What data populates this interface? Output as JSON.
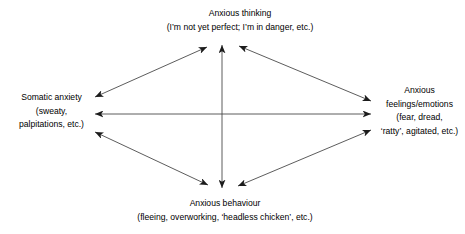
{
  "diagram": {
    "type": "four-node bidirectional cycle",
    "background_color": "#ffffff",
    "text_color": "#000000",
    "arrow_color": "#3b3b3b",
    "nodes": {
      "thinking": {
        "name": "Anxious thinking",
        "lines": [
          "Anxious thinking",
          "(I’m not yet perfect; I’m in danger, etc.)"
        ]
      },
      "somatic": {
        "name": "Somatic anxiety",
        "lines": [
          "Somatic anxiety",
          "(sweaty,",
          "palpitations, etc.)"
        ]
      },
      "feelings": {
        "name": "Anxious feelings/emotions",
        "lines": [
          "Anxious",
          "feelings/emotions",
          "(fear, dread,",
          "‘ratty’, agitated, etc.)"
        ]
      },
      "behaviour": {
        "name": "Anxious behaviour",
        "lines": [
          "Anxious behaviour",
          "(fleeing, overworking, ‘headless chicken’, etc.)"
        ]
      }
    },
    "connectors": [
      {
        "id": "thinking-behaviour",
        "from": "Anxious thinking",
        "to": "Anxious behaviour",
        "style": "double-headed",
        "orientation": "vertical"
      },
      {
        "id": "somatic-feelings",
        "from": "Somatic anxiety",
        "to": "Anxious feelings/emotions",
        "style": "double-headed",
        "orientation": "horizontal"
      },
      {
        "id": "somatic-thinking",
        "from": "Somatic anxiety",
        "to": "Anxious thinking",
        "style": "double-headed",
        "orientation": "diagonal"
      },
      {
        "id": "thinking-feelings",
        "from": "Anxious thinking",
        "to": "Anxious feelings/emotions",
        "style": "double-headed",
        "orientation": "diagonal"
      },
      {
        "id": "somatic-behaviour",
        "from": "Somatic anxiety",
        "to": "Anxious behaviour",
        "style": "double-headed",
        "orientation": "diagonal"
      },
      {
        "id": "behaviour-feelings",
        "from": "Anxious behaviour",
        "to": "Anxious feelings/emotions",
        "style": "double-headed",
        "orientation": "diagonal"
      }
    ]
  }
}
